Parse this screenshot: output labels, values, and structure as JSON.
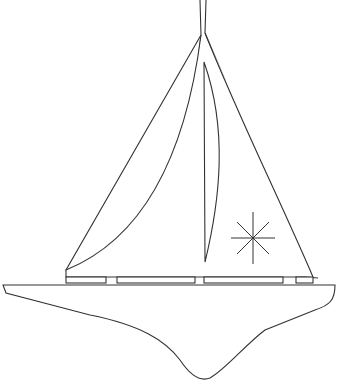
{
  "image": {
    "subject": "sailboat line drawing",
    "background": "#ffffff",
    "stroke": "#333333"
  }
}
